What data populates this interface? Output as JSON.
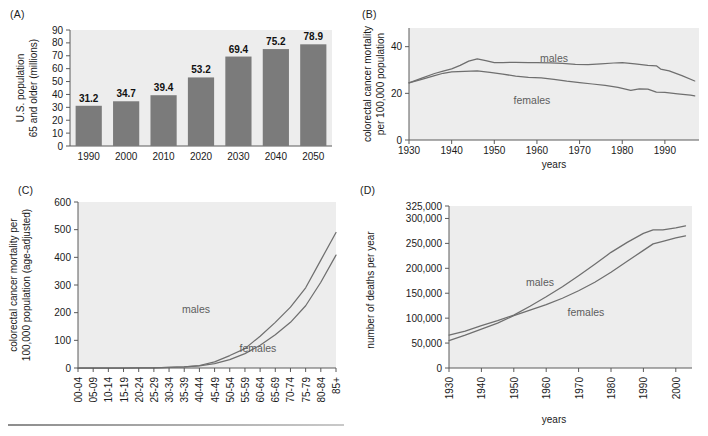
{
  "figure": {
    "background": "#ffffff",
    "plot_background": "#ededed",
    "bar_color": "#7b7b7b",
    "line_color": "#6f6f6f",
    "label_color": "#5d5d5d"
  },
  "panels": {
    "a": {
      "label": "(A)",
      "ylabel_line1": "U.S. population",
      "ylabel_line2": "65 and older (millions)"
    },
    "b": {
      "label": "(B)",
      "ylabel_line1": "colorectal cancer mortality",
      "ylabel_line2": "per 100,000 population",
      "xlabel": "years"
    },
    "c": {
      "label": "(C)",
      "ylabel_line1": "colorectal cancer mortality per",
      "ylabel_line2": "100,000 population (age-adjusted)"
    },
    "d": {
      "label": "(D)",
      "ylabel": "number of deaths per year",
      "xlabel": "years"
    }
  },
  "chart_data": [
    {
      "panel": "A",
      "type": "bar",
      "title": "",
      "xlabel": "",
      "ylabel": "U.S. population 65 and older (millions)",
      "categories": [
        "1990",
        "2000",
        "2010",
        "2020",
        "2030",
        "2040",
        "2050"
      ],
      "values": [
        31.2,
        34.7,
        39.4,
        53.2,
        69.4,
        75.2,
        78.9
      ],
      "data_labels": [
        "31.2",
        "34.7",
        "39.4",
        "53.2",
        "69.4",
        "75.2",
        "78.9"
      ],
      "ylim": [
        0,
        90
      ],
      "yticks": [
        0,
        10,
        20,
        30,
        40,
        50,
        60,
        70,
        80,
        90
      ],
      "ytick_labels": [
        "0",
        "10",
        "20",
        "30",
        "40",
        "50",
        "60",
        "70",
        "80",
        "90"
      ],
      "grid": false,
      "legend": "none"
    },
    {
      "panel": "B",
      "type": "line",
      "title": "",
      "xlabel": "years",
      "ylabel": "colorectal cancer mortality per 100,000 population",
      "ylim": [
        0,
        48
      ],
      "yticks": [
        0,
        20,
        40
      ],
      "ytick_labels": [
        "0",
        "20",
        "40"
      ],
      "xlim": [
        1930,
        1998
      ],
      "xticks": [
        1930,
        1940,
        1950,
        1960,
        1970,
        1980,
        1990
      ],
      "xtick_labels": [
        "1930",
        "1940",
        "1950",
        "1960",
        "1970",
        "1980",
        "1990"
      ],
      "grid": false,
      "legend": "inline-labels",
      "series": [
        {
          "name": "males",
          "x": [
            1930,
            1933,
            1936,
            1938,
            1940,
            1942,
            1944,
            1946,
            1948,
            1950,
            1952,
            1955,
            1958,
            1960,
            1963,
            1966,
            1969,
            1972,
            1975,
            1978,
            1980,
            1983,
            1986,
            1988,
            1989,
            1991,
            1994,
            1997
          ],
          "values": [
            24.5,
            26.5,
            28.5,
            29.5,
            30.5,
            32.0,
            33.8,
            34.8,
            34.0,
            33.2,
            33.2,
            33.3,
            33.2,
            33.2,
            33.1,
            32.8,
            32.4,
            32.3,
            32.6,
            33.0,
            33.2,
            32.6,
            32.0,
            31.8,
            30.4,
            29.6,
            27.6,
            25.3
          ]
        },
        {
          "name": "females",
          "x": [
            1930,
            1933,
            1936,
            1938,
            1940,
            1943,
            1946,
            1949,
            1952,
            1955,
            1958,
            1961,
            1964,
            1967,
            1970,
            1973,
            1976,
            1979,
            1982,
            1984,
            1986,
            1988,
            1990,
            1993,
            1996,
            1997
          ],
          "values": [
            24.5,
            26.0,
            27.6,
            28.6,
            29.2,
            29.4,
            29.6,
            29.0,
            28.2,
            27.4,
            26.8,
            26.6,
            26.0,
            25.2,
            24.6,
            24.0,
            23.4,
            22.6,
            21.3,
            21.9,
            21.8,
            20.5,
            20.4,
            19.8,
            19.2,
            18.9
          ]
        }
      ]
    },
    {
      "panel": "C",
      "type": "line",
      "title": "",
      "xlabel": "",
      "ylabel": "colorectal cancer mortality per 100,000 population (age-adjusted)",
      "ylim": [
        0,
        600
      ],
      "yticks": [
        0,
        100,
        200,
        300,
        400,
        500,
        600
      ],
      "ytick_labels": [
        "0",
        "100",
        "200",
        "300",
        "400",
        "500",
        "600"
      ],
      "categories": [
        "00-04",
        "05-09",
        "10-14",
        "15-19",
        "20-24",
        "25-29",
        "30-34",
        "35-39",
        "40-44",
        "45-49",
        "50-54",
        "55-59",
        "60-64",
        "65-69",
        "70-74",
        "75-79",
        "80-84",
        "85+"
      ],
      "grid": false,
      "legend": "inline-labels",
      "series": [
        {
          "name": "males",
          "values": [
            0,
            0,
            0,
            0,
            0.3,
            0.8,
            2,
            4,
            9,
            22,
            45,
            70,
            115,
            165,
            220,
            290,
            390,
            490
          ]
        },
        {
          "name": "females",
          "values": [
            0,
            0,
            0,
            0,
            0.3,
            0.8,
            2,
            4,
            8,
            16,
            30,
            52,
            82,
            120,
            165,
            225,
            310,
            408
          ]
        }
      ]
    },
    {
      "panel": "D",
      "type": "line",
      "title": "",
      "xlabel": "years",
      "ylabel": "number of deaths per year",
      "ylim": [
        0,
        325000
      ],
      "yticks": [
        0,
        50000,
        100000,
        150000,
        200000,
        250000,
        300000,
        325000
      ],
      "ytick_labels": [
        "0",
        "50,000",
        "100,000",
        "150,000",
        "200,000",
        "250,000",
        "300,000",
        "325,000"
      ],
      "xlim": [
        1930,
        2005
      ],
      "xticks": [
        1930,
        1940,
        1950,
        1960,
        1970,
        1980,
        1990,
        2000
      ],
      "xtick_labels": [
        "1930",
        "1940",
        "1950",
        "1960",
        "1970",
        "1980",
        "1990",
        "2000"
      ],
      "grid": false,
      "legend": "inline-labels",
      "series": [
        {
          "name": "males",
          "x": [
            1930,
            1935,
            1940,
            1945,
            1950,
            1955,
            1960,
            1965,
            1970,
            1975,
            1980,
            1985,
            1990,
            1993,
            1996,
            2000,
            2003
          ],
          "values": [
            66000,
            74000,
            85000,
            95000,
            106000,
            124000,
            143000,
            163000,
            185000,
            208000,
            232000,
            252000,
            270000,
            277000,
            277000,
            281000,
            285000
          ]
        },
        {
          "name": "females",
          "x": [
            1930,
            1935,
            1940,
            1945,
            1950,
            1955,
            1960,
            1965,
            1970,
            1975,
            1980,
            1985,
            1990,
            1993,
            1996,
            2000,
            2003
          ],
          "values": [
            55000,
            66000,
            78000,
            90000,
            105000,
            116000,
            127000,
            140000,
            155000,
            172000,
            192000,
            214000,
            236000,
            249000,
            254000,
            261000,
            265000
          ]
        }
      ]
    }
  ]
}
